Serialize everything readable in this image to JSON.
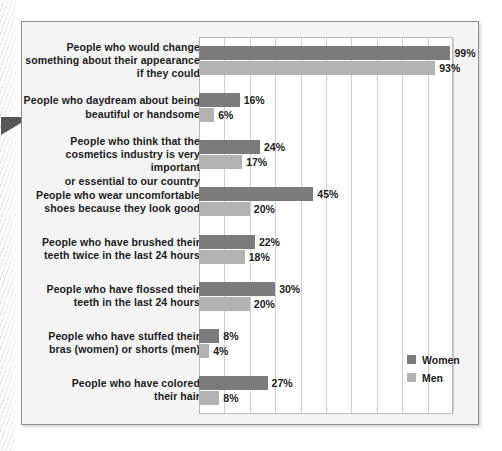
{
  "figure": {
    "background_color": "#f4f4f4",
    "frame_color": "#8e8e8e",
    "margin_pointer": "triangle-pointer"
  },
  "legend": {
    "position": "inside-bottom-right",
    "items": [
      {
        "label": "Women",
        "color": "#7b7b7b",
        "swatch": "women-swatch"
      },
      {
        "label": "Men",
        "color": "#b2b2b2",
        "swatch": "men-swatch"
      }
    ]
  },
  "chart_data": {
    "type": "bar",
    "orientation": "horizontal",
    "title": "",
    "subtitle": "",
    "xlabel": "",
    "ylabel": "",
    "xlim": [
      0,
      100
    ],
    "xticks": [
      0,
      10,
      20,
      30,
      40,
      50,
      60,
      70,
      80,
      90,
      100
    ],
    "grid": true,
    "grid_axis": "x",
    "legend_position": "inside-bottom-right",
    "value_suffix": "%",
    "categories": [
      "People who would change something about their appearance if they could",
      "People who daydream about being beautiful or handsome",
      "People who think that the cosmetics industry is very important or essential to our country",
      "People who wear uncomfortable shoes because they look good",
      "People who have brushed their teeth twice in the last 24 hours",
      "People who have flossed their teeth in the last 24 hours",
      "People who have stuffed their bras (women) or shorts (men)",
      "People who have colored their hair"
    ],
    "category_lines": [
      [
        "People who would change",
        "something about their appearance",
        "if they could"
      ],
      [
        "People who daydream about being",
        "beautiful or handsome"
      ],
      [
        "People who think that the",
        "cosmetics industry is very important",
        "or essential to our country"
      ],
      [
        "People who wear uncomfortable",
        "shoes because they look good"
      ],
      [
        "People who have brushed their",
        "teeth twice in the last 24 hours"
      ],
      [
        "People who have flossed their",
        "teeth in the last 24 hours"
      ],
      [
        "People who have stuffed their",
        "bras (women) or shorts (men)"
      ],
      [
        "People who have colored",
        "their hair"
      ]
    ],
    "series": [
      {
        "name": "Women",
        "color": "#7b7b7b",
        "values": [
          99,
          16,
          24,
          45,
          22,
          30,
          8,
          27
        ],
        "labels": [
          "99%",
          "16%",
          "24%",
          "45%",
          "22%",
          "30%",
          "8%",
          "27%"
        ]
      },
      {
        "name": "Men",
        "color": "#b2b2b2",
        "values": [
          93,
          6,
          17,
          20,
          18,
          20,
          4,
          8
        ],
        "labels": [
          "93%",
          "6%",
          "17%",
          "20%",
          "18%",
          "20%",
          "4%",
          "8%"
        ]
      }
    ]
  }
}
